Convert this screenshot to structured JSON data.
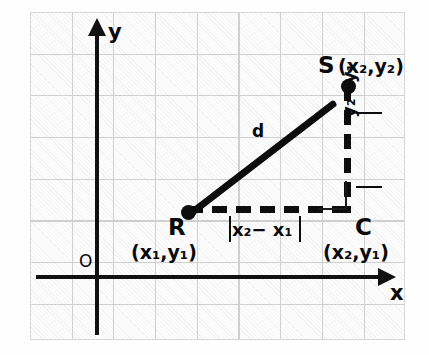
{
  "figure": {
    "kind": "coordinate-geometry-diagram",
    "topic": "distance-formula"
  },
  "axes": {
    "x_label": "x",
    "y_label": "y",
    "origin_label": "O"
  },
  "points": {
    "r": {
      "name": "R",
      "coord": "(x₁,y₁)"
    },
    "s": {
      "name": "S",
      "coord": "(x₂,y₂)"
    },
    "c": {
      "name": "C",
      "coord": "(x₂,y₁)"
    }
  },
  "segments": {
    "hypotenuse_label": "d",
    "horizontal_leg_label": "x₂− x₁",
    "vertical_leg_label": "y₂−y₁"
  },
  "colors": {
    "ink": "#0d0d0d",
    "grid": "#c9c9c9",
    "paper": "#ffffff"
  }
}
